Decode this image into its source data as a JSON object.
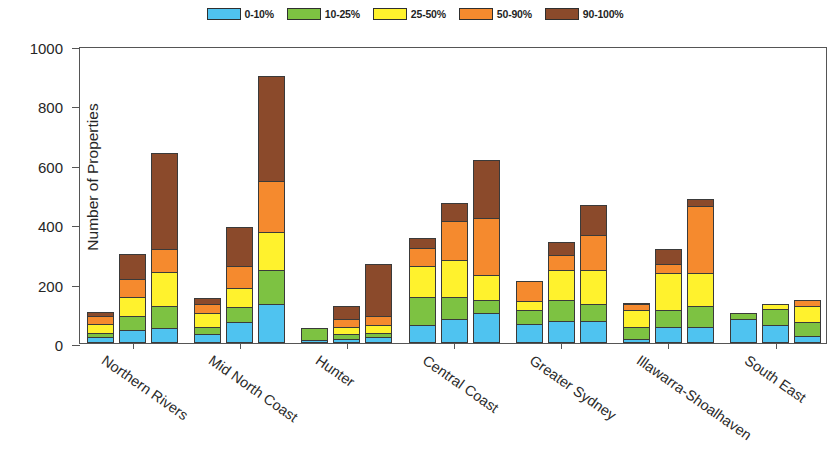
{
  "chart_data": {
    "type": "bar",
    "subtype": "stacked-grouped",
    "title": "",
    "xlabel": "",
    "ylabel": "Number of Properties",
    "ylim": [
      0,
      1000
    ],
    "yticks": [
      0,
      200,
      400,
      600,
      800,
      1000
    ],
    "grid": false,
    "legend_position": "top-center",
    "bars_per_group": 3,
    "categories": [
      "Northern Rivers",
      "Mid North Coast",
      "Hunter",
      "Central Coast",
      "Greater Sydney",
      "Illawarra-Shoalhaven",
      "South East"
    ],
    "series": [
      {
        "name": "0-10%",
        "color": "#4FC3F0",
        "values": [
          [
            20,
            45,
            50
          ],
          [
            30,
            70,
            130
          ],
          [
            10,
            15,
            20
          ],
          [
            60,
            80,
            100
          ],
          [
            65,
            75,
            75
          ],
          [
            15,
            55,
            55
          ],
          [
            80,
            60,
            25
          ]
        ]
      },
      {
        "name": "10-25%",
        "color": "#7DC242",
        "values": [
          [
            15,
            45,
            75
          ],
          [
            25,
            50,
            115
          ],
          [
            40,
            15,
            15
          ],
          [
            95,
            75,
            45
          ],
          [
            45,
            70,
            55
          ],
          [
            40,
            55,
            70
          ],
          [
            20,
            55,
            45
          ]
        ]
      },
      {
        "name": "25-50%",
        "color": "#FFF22D",
        "values": [
          [
            30,
            65,
            115
          ],
          [
            45,
            65,
            130
          ],
          [
            0,
            25,
            25
          ],
          [
            105,
            125,
            85
          ],
          [
            30,
            100,
            115
          ],
          [
            55,
            125,
            110
          ],
          [
            0,
            15,
            55
          ]
        ]
      },
      {
        "name": "50-90%",
        "color": "#F58A2E",
        "values": [
          [
            25,
            60,
            75
          ],
          [
            30,
            75,
            170
          ],
          [
            0,
            25,
            30
          ],
          [
            60,
            130,
            190
          ],
          [
            70,
            50,
            120
          ],
          [
            20,
            30,
            225
          ],
          [
            0,
            0,
            20
          ]
        ]
      },
      {
        "name": "90-100%",
        "color": "#8B4A2B",
        "values": [
          [
            15,
            85,
            325
          ],
          [
            20,
            130,
            355
          ],
          [
            0,
            45,
            175
          ],
          [
            35,
            60,
            195
          ],
          [
            0,
            45,
            100
          ],
          [
            5,
            50,
            25
          ],
          [
            0,
            0,
            0
          ]
        ]
      }
    ],
    "group_totals": [
      [
        105,
        300,
        640
      ],
      [
        150,
        390,
        900
      ],
      [
        50,
        125,
        265
      ],
      [
        355,
        470,
        615
      ],
      [
        210,
        340,
        465
      ],
      [
        135,
        315,
        485
      ],
      [
        100,
        130,
        145
      ]
    ]
  },
  "legend": {
    "items": [
      {
        "label": "0-10%",
        "color": "#4FC3F0"
      },
      {
        "label": "10-25%",
        "color": "#7DC242"
      },
      {
        "label": "25-50%",
        "color": "#FFF22D"
      },
      {
        "label": "50-90%",
        "color": "#F58A2E"
      },
      {
        "label": "90-100%",
        "color": "#8B4A2B"
      }
    ]
  },
  "axes": {
    "y_title": "Number of Properties",
    "y_tick_labels": [
      "0",
      "200",
      "400",
      "600",
      "800",
      "1000"
    ]
  }
}
